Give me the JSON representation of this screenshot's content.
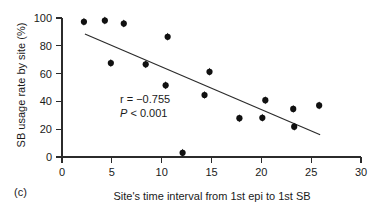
{
  "figure": {
    "panel_label": "(c)",
    "background": "#ffffff",
    "point_color": "#111111",
    "line_color": "#2b2b2b"
  },
  "annotation": {
    "r_text": "r = −0.755",
    "p_italic": "P",
    "p_rest": " < 0.001"
  },
  "chart_data": {
    "type": "scatter",
    "title": "",
    "xlabel": "Site's time interval from 1st epi to 1st SB",
    "ylabel": "SB usage rate by site (%)",
    "xlim": [
      0,
      30
    ],
    "ylim": [
      0,
      100
    ],
    "xticks": [
      0,
      5,
      10,
      15,
      20,
      25,
      30
    ],
    "yticks": [
      0,
      20,
      40,
      60,
      80,
      100
    ],
    "xtick_labels": [
      "0",
      "5",
      "10",
      "15",
      "20",
      "25",
      "30"
    ],
    "ytick_labels": [
      "0",
      "20",
      "40",
      "60",
      "80",
      "100"
    ],
    "grid": false,
    "legend": false,
    "annotations": [
      "r = −0.755",
      "P < 0.001"
    ],
    "points": [
      {
        "x": 2.2,
        "y": 97.3
      },
      {
        "x": 4.3,
        "y": 98.2
      },
      {
        "x": 6.2,
        "y": 96.0
      },
      {
        "x": 4.9,
        "y": 67.6
      },
      {
        "x": 8.4,
        "y": 66.7
      },
      {
        "x": 10.6,
        "y": 86.5
      },
      {
        "x": 10.4,
        "y": 51.6
      },
      {
        "x": 12.1,
        "y": 3.0
      },
      {
        "x": 14.8,
        "y": 61.3
      },
      {
        "x": 14.3,
        "y": 44.6
      },
      {
        "x": 17.8,
        "y": 27.9
      },
      {
        "x": 20.1,
        "y": 28.2
      },
      {
        "x": 20.4,
        "y": 40.9
      },
      {
        "x": 23.2,
        "y": 34.6
      },
      {
        "x": 23.3,
        "y": 21.8
      },
      {
        "x": 25.8,
        "y": 37.1
      }
    ],
    "fit_line": {
      "x_start": 2.3,
      "y_start": 88.5,
      "x_end": 25.9,
      "y_end": 16.0,
      "r": -0.755,
      "p": "< 0.001"
    }
  }
}
